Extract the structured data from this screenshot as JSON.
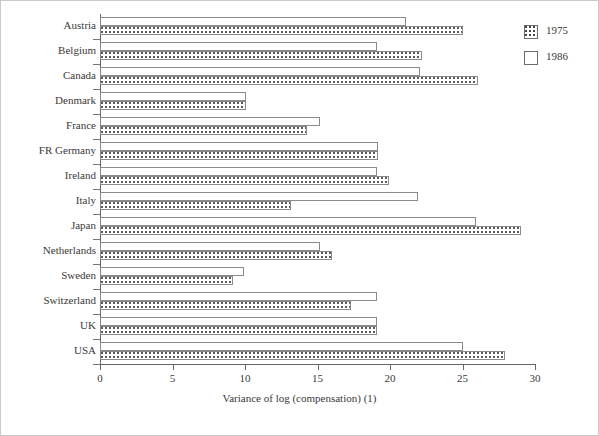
{
  "chart_data": {
    "type": "bar",
    "orientation": "horizontal",
    "title": "",
    "xlabel": "Variance of log (compensation) (1)",
    "ylabel": "",
    "xlim": [
      0,
      30
    ],
    "xticks": [
      0,
      5,
      10,
      15,
      20,
      25,
      30
    ],
    "grid": false,
    "legend_position": "right-top",
    "categories": [
      "Austria",
      "Belgium",
      "Canada",
      "Denmark",
      "France",
      "FR Germany",
      "Ireland",
      "Italy",
      "Japan",
      "Netherlands",
      "Sweden",
      "Switzerland",
      "UK",
      "USA"
    ],
    "series": [
      {
        "name": "1975",
        "pattern": "dotted",
        "values": [
          25.0,
          22.2,
          26.1,
          10.1,
          14.3,
          19.2,
          19.9,
          13.2,
          29.0,
          16.0,
          9.2,
          17.3,
          19.1,
          27.9
        ]
      },
      {
        "name": "1986",
        "pattern": "solid-white",
        "values": [
          21.1,
          19.1,
          22.1,
          10.1,
          15.2,
          19.2,
          19.1,
          21.9,
          25.9,
          15.2,
          9.9,
          19.1,
          19.1,
          25.0
        ]
      }
    ]
  },
  "legend": {
    "items": [
      {
        "label": "1975",
        "swatch": "dotted-square-swatch"
      },
      {
        "label": "1986",
        "swatch": "white-square-swatch"
      }
    ]
  }
}
